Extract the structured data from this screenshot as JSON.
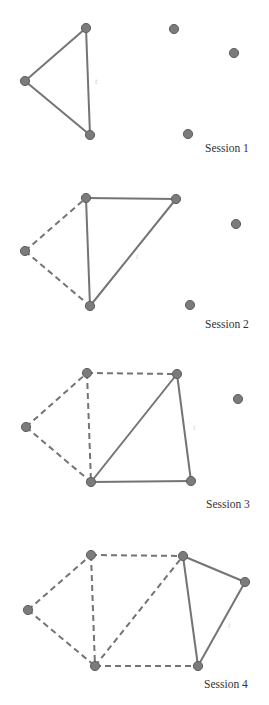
{
  "figure": {
    "colors": {
      "edge": "#747474",
      "node_fill": "#7b7b7b",
      "node_stroke": "#5e5e5e",
      "label": "#333333"
    },
    "sessions": [
      {
        "label": "Session 1",
        "label_pos": [
          205,
          152
        ],
        "faint_mark": {
          "text": "t",
          "pos": [
            95,
            84
          ]
        },
        "nodes": [
          [
            25,
            81
          ],
          [
            86,
            28
          ],
          [
            90,
            135
          ],
          [
            174,
            29
          ],
          [
            234,
            53
          ],
          [
            188,
            134
          ]
        ],
        "solid_edges": [
          [
            0,
            1
          ],
          [
            0,
            2
          ],
          [
            1,
            2
          ]
        ],
        "dashed_edges": []
      },
      {
        "label": "Session 2",
        "label_pos": [
          205,
          328
        ],
        "faint_mark": {
          "text": "t",
          "pos": [
            136,
            259
          ]
        },
        "nodes": [
          [
            25,
            251
          ],
          [
            86,
            198
          ],
          [
            90,
            306
          ],
          [
            176,
            199
          ],
          [
            236,
            224
          ],
          [
            190,
            305
          ]
        ],
        "solid_edges": [
          [
            1,
            2
          ],
          [
            1,
            3
          ],
          [
            2,
            3
          ]
        ],
        "dashed_edges": [
          [
            0,
            1
          ],
          [
            0,
            2
          ]
        ]
      },
      {
        "label": "Session 3",
        "label_pos": [
          206,
          508
        ],
        "faint_mark": {
          "text": "t",
          "pos": [
            193,
            430
          ]
        },
        "nodes": [
          [
            26,
            427
          ],
          [
            87,
            373
          ],
          [
            91,
            482
          ],
          [
            177,
            374
          ],
          [
            238,
            399
          ],
          [
            191,
            481
          ]
        ],
        "solid_edges": [
          [
            2,
            3
          ],
          [
            3,
            5
          ],
          [
            2,
            5
          ]
        ],
        "dashed_edges": [
          [
            0,
            1
          ],
          [
            0,
            2
          ],
          [
            1,
            2
          ],
          [
            1,
            3
          ]
        ]
      },
      {
        "label": "Session 4",
        "label_pos": [
          204,
          688
        ],
        "faint_mark": {
          "text": "t",
          "pos": [
            228,
            628
          ]
        },
        "nodes": [
          [
            28,
            610
          ],
          [
            91,
            555
          ],
          [
            95,
            666
          ],
          [
            183,
            556
          ],
          [
            245,
            582
          ],
          [
            198,
            666
          ]
        ],
        "solid_edges": [
          [
            3,
            4
          ],
          [
            3,
            5
          ],
          [
            4,
            5
          ]
        ],
        "dashed_edges": [
          [
            0,
            1
          ],
          [
            0,
            2
          ],
          [
            1,
            2
          ],
          [
            1,
            3
          ],
          [
            2,
            3
          ],
          [
            2,
            5
          ]
        ]
      }
    ]
  }
}
